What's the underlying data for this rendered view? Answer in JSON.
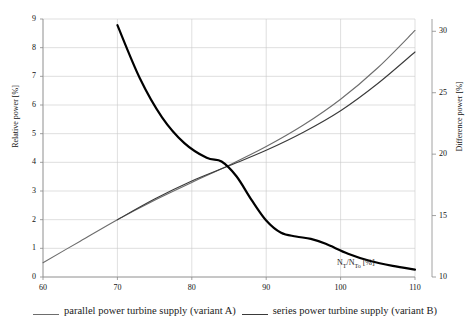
{
  "chart_data": {
    "type": "line",
    "title": "",
    "xlabel": "N_T/N_To [%]",
    "xlabel_parts": {
      "lead": "N",
      "sub1": "T",
      "mid": "/N",
      "sub2": "To",
      "unit": " [%]"
    },
    "ylabel": "Relative power [%]",
    "ylabel_right": "Difference power [%]",
    "xlim": [
      60,
      110
    ],
    "ylim": [
      0,
      9
    ],
    "ylim_right": [
      10,
      31
    ],
    "xticks": [
      60,
      70,
      80,
      90,
      100,
      110
    ],
    "yticks": [
      0,
      1,
      2,
      3,
      4,
      5,
      6,
      7,
      8,
      9
    ],
    "yticks_right": [
      10,
      15,
      20,
      25,
      30
    ],
    "grid": true,
    "legend_position": "bottom",
    "series": [
      {
        "name": "parallel power turbine supply (variant A)",
        "axis": "left",
        "color": "#6d6d6d",
        "width": 1.1,
        "x": [
          60,
          65,
          70,
          75,
          80,
          85,
          90,
          95,
          100,
          105,
          110
        ],
        "values": [
          0.5,
          1.25,
          2.0,
          2.68,
          3.3,
          3.9,
          4.55,
          5.3,
          6.2,
          7.3,
          8.6
        ]
      },
      {
        "name": "series power turbine supply (variant B)",
        "axis": "left",
        "color": "#3a3a3a",
        "width": 1.1,
        "x": [
          70,
          75,
          80,
          85,
          90,
          95,
          100,
          105,
          110
        ],
        "values": [
          2.0,
          2.72,
          3.35,
          3.88,
          4.42,
          5.05,
          5.8,
          6.75,
          7.85
        ]
      },
      {
        "name": "difference power",
        "axis": "right",
        "color": "#000000",
        "width": 2.2,
        "x": [
          70,
          73,
          76,
          79,
          82,
          84,
          86,
          88,
          90,
          92,
          94,
          96,
          98,
          101,
          104,
          107,
          110
        ],
        "values": [
          30.5,
          26.2,
          23.0,
          20.9,
          19.7,
          19.4,
          18.2,
          16.3,
          14.6,
          13.6,
          13.3,
          13.1,
          12.7,
          11.9,
          11.3,
          10.9,
          10.6
        ]
      }
    ]
  },
  "axes": {
    "y_left_title": "Relative power [%]",
    "y_right_title": "Difference power [%]",
    "x_inline_title_lead": "N",
    "x_inline_title_sub1": "T",
    "x_inline_title_mid": "/N",
    "x_inline_title_sub2": "To",
    "x_inline_title_unit": " [%]"
  },
  "legend": {
    "items": [
      {
        "label": "parallel power turbine supply (variant A)",
        "color": "#6d6d6d"
      },
      {
        "label": "series power turbine supply  (variant B)",
        "color": "#3a3a3a"
      }
    ]
  }
}
